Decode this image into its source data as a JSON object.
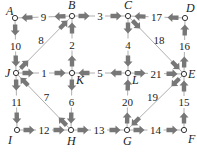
{
  "diagram": {
    "type": "directed-graph",
    "colors": {
      "arrow": "#777777",
      "line": "#999999",
      "node_fill": "#ffffff",
      "node_stroke": "#333333",
      "text": "#222222"
    },
    "nodes": [
      {
        "id": "A",
        "x": 15,
        "y": 18,
        "lx": 6,
        "ly": 15
      },
      {
        "id": "B",
        "x": 72,
        "y": 16,
        "lx": 68,
        "ly": 9
      },
      {
        "id": "C",
        "x": 128,
        "y": 16,
        "lx": 124,
        "ly": 9
      },
      {
        "id": "D",
        "x": 185,
        "y": 18,
        "lx": 186,
        "ly": 12
      },
      {
        "id": "J",
        "x": 16,
        "y": 73,
        "lx": 5,
        "ly": 77
      },
      {
        "id": "K",
        "x": 72,
        "y": 73,
        "lx": 76,
        "ly": 84
      },
      {
        "id": "L",
        "x": 128,
        "y": 73,
        "lx": 132,
        "ly": 84
      },
      {
        "id": "E",
        "x": 184,
        "y": 74,
        "lx": 188,
        "ly": 78
      },
      {
        "id": "I",
        "x": 17,
        "y": 130,
        "lx": 8,
        "ly": 144
      },
      {
        "id": "H",
        "x": 71,
        "y": 130,
        "lx": 67,
        "ly": 145
      },
      {
        "id": "G",
        "x": 127,
        "y": 130,
        "lx": 123,
        "ly": 145
      },
      {
        "id": "F",
        "x": 184,
        "y": 130,
        "lx": 188,
        "ly": 143
      }
    ],
    "edges": [
      {
        "label": "9",
        "from": "B",
        "to": "A"
      },
      {
        "label": "3",
        "from": "B",
        "to": "C"
      },
      {
        "label": "17",
        "from": "D",
        "to": "C"
      },
      {
        "label": "10",
        "from": "A",
        "to": "J"
      },
      {
        "label": "8",
        "from": "J",
        "to": "B"
      },
      {
        "label": "2",
        "from": "K",
        "to": "B"
      },
      {
        "label": "4",
        "from": "C",
        "to": "L"
      },
      {
        "label": "18",
        "from": "C",
        "to": "E"
      },
      {
        "label": "16",
        "from": "E",
        "to": "D"
      },
      {
        "label": "1",
        "from": "J",
        "to": "K"
      },
      {
        "label": "5",
        "from": "L",
        "to": "K"
      },
      {
        "label": "21",
        "from": "L",
        "to": "E"
      },
      {
        "label": "11",
        "from": "J",
        "to": "I"
      },
      {
        "label": "7",
        "from": "H",
        "to": "J"
      },
      {
        "label": "6",
        "from": "K",
        "to": "H"
      },
      {
        "label": "20",
        "from": "G",
        "to": "L"
      },
      {
        "label": "19",
        "from": "E",
        "to": "G"
      },
      {
        "label": "15",
        "from": "F",
        "to": "E"
      },
      {
        "label": "12",
        "from": "I",
        "to": "H"
      },
      {
        "label": "13",
        "from": "H",
        "to": "G"
      },
      {
        "label": "14",
        "from": "G",
        "to": "F"
      }
    ]
  }
}
